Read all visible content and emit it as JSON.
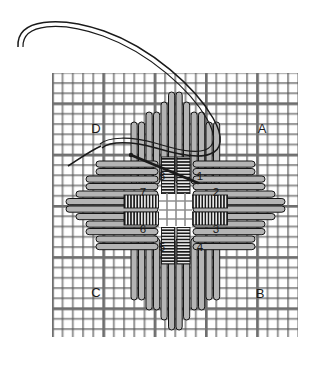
{
  "diagram": {
    "kind": "embroidery-stitch-order-chart",
    "background_color": "#ffffff",
    "ink_color": "#1a1a1a",
    "fabric_color": "#8c8c8c",
    "stitch_fill_color": "#a8a8a8",
    "stitch_outline_color": "#141414"
  },
  "fabric": {
    "name": "even-weave-canvas-grid",
    "left": 52,
    "top": 73,
    "width": 246,
    "height": 264,
    "cell_size": 10.25,
    "cols": 24,
    "rows": 26,
    "heavy_line_every": 5
  },
  "corner_labels": [
    {
      "id": "A",
      "text": "A",
      "x": 262,
      "y": 133
    },
    {
      "id": "B",
      "text": "B",
      "x": 260,
      "y": 298
    },
    {
      "id": "C",
      "text": "C",
      "x": 96,
      "y": 297
    },
    {
      "id": "D",
      "text": "D",
      "x": 96,
      "y": 133
    }
  ],
  "step_labels": [
    {
      "id": "1",
      "text": "1",
      "x": 200,
      "y": 180
    },
    {
      "id": "2",
      "text": "2",
      "x": 216,
      "y": 196
    },
    {
      "id": "3",
      "text": "3",
      "x": 216,
      "y": 233
    },
    {
      "id": "4",
      "text": "4",
      "x": 200,
      "y": 251
    },
    {
      "id": "5",
      "text": "5",
      "x": 162,
      "y": 251
    },
    {
      "id": "6",
      "text": "6",
      "x": 143,
      "y": 233
    },
    {
      "id": "7",
      "text": "7",
      "x": 143,
      "y": 196
    },
    {
      "id": "8",
      "text": "8",
      "x": 162,
      "y": 180
    }
  ],
  "center": {
    "name": "open-center-square",
    "x": 159,
    "y": 194,
    "width": 33,
    "height": 33
  },
  "needle_thread": {
    "name": "working-thread-loop",
    "loop_path": "M 18 47 C 16 18, 60 16, 104 31 C 152 48, 196 88, 213 118 C 224 137, 222 150, 210 154 C 198 159, 176 154, 156 148 C 132 141, 110 141, 102 148",
    "loop_path_inner": "M 22 47 C 21 22, 61 20, 103 35 C 150 52, 192 90, 208 119 C 218 137, 216 147, 206 151 C 195 155, 175 150, 155 144 C 130 137, 108 138, 100 145",
    "tail_path": "M 102 148 C 90 153, 78 160, 68 166",
    "needle_path": "M 131 155 L 198 183",
    "anchor_point": {
      "x": 131,
      "y": 155
    }
  },
  "stitch_groups": {
    "north_vertical_fan": "vertical stitch bundle above center",
    "south_vertical_fan": "vertical stitch bundle below center",
    "east_horizontal_fan": "horizontal stitch bundle right of center",
    "west_horizontal_fan": "horizontal stitch bundle left of center",
    "center_coils": "four short coiled bars framing open center"
  }
}
